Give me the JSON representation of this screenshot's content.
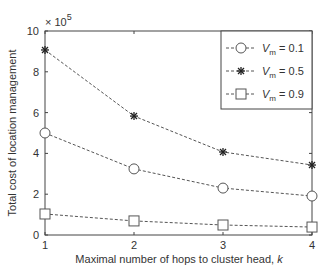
{
  "chart_data": {
    "type": "line",
    "title": "",
    "xlabel": "Maximal number of hops to cluster head, k",
    "xlabel_main": "Maximal number of hops to cluster head, ",
    "xlabel_var": "k",
    "ylabel": "Total cost of location management",
    "y_multiplier": "× 10",
    "y_multiplier_exp": "5",
    "x": [
      1,
      2,
      3,
      4
    ],
    "xticks": [
      "1",
      "2",
      "3",
      "4"
    ],
    "yticks": [
      "0",
      "2",
      "4",
      "6",
      "8",
      "10"
    ],
    "xlim": [
      1,
      4
    ],
    "ylim": [
      0,
      10
    ],
    "grid": false,
    "legend_position": "upper right",
    "series": [
      {
        "name": "V_m = 0.1",
        "label_var": "V",
        "label_sub": "m",
        "label_val": "= 0.1",
        "marker": "circle",
        "values": [
          5.0,
          3.24,
          2.3,
          1.91
        ]
      },
      {
        "name": "V_m = 0.5",
        "label_var": "V",
        "label_sub": "m",
        "label_val": "= 0.5",
        "marker": "star",
        "values": [
          9.07,
          5.83,
          4.07,
          3.43
        ]
      },
      {
        "name": "V_m = 0.9",
        "label_var": "V",
        "label_sub": "m",
        "label_val": "= 0.9",
        "marker": "square",
        "values": [
          1.03,
          0.69,
          0.49,
          0.39
        ]
      }
    ],
    "colors": {
      "line": "#555555",
      "axis": "#444444"
    }
  }
}
